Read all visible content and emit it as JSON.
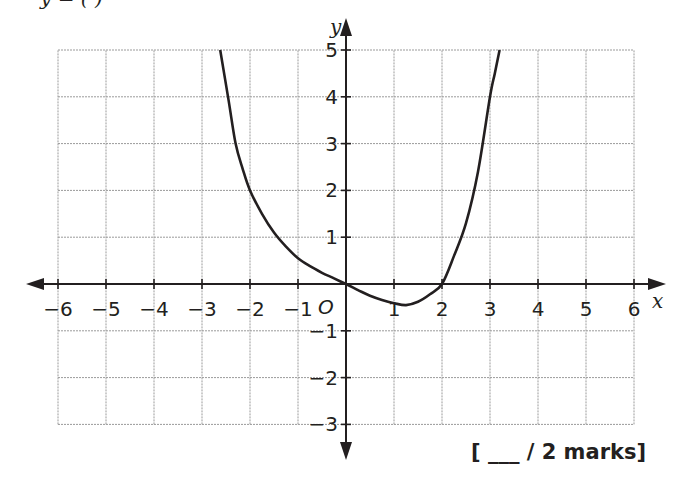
{
  "header": {
    "cut_text": "y = (      )"
  },
  "footer": {
    "marks_label": "[ ___ / 2 marks]"
  },
  "chart_data": {
    "type": "line",
    "title": "",
    "xlabel": "x",
    "ylabel": "y",
    "origin_label": "O",
    "xlim": [
      -6,
      6
    ],
    "ylim": [
      -3,
      5
    ],
    "grid": true,
    "x_ticks": [
      -6,
      -5,
      -4,
      -3,
      -2,
      -1,
      1,
      2,
      3,
      4,
      5,
      6
    ],
    "x_tick_labels": [
      "−6",
      "−5",
      "−4",
      "−3",
      "−2",
      "−1",
      "1",
      "2",
      "3",
      "4",
      "5",
      "6"
    ],
    "y_ticks": [
      -3,
      -2,
      -1,
      1,
      2,
      3,
      4,
      5
    ],
    "y_tick_labels": [
      "−3",
      "−2",
      "−1",
      "1",
      "2",
      "3",
      "4",
      "5"
    ],
    "series": [
      {
        "name": "curve",
        "x": [
          -2.62,
          -2.45,
          -2.3,
          -2.15,
          -2.0,
          -1.75,
          -1.5,
          -1.25,
          -1.0,
          -0.75,
          -0.5,
          -0.25,
          0.0,
          0.25,
          0.5,
          0.75,
          1.0,
          1.25,
          1.5,
          1.75,
          2.0,
          2.25,
          2.5,
          2.75,
          3.0,
          3.1,
          3.2
        ],
        "y": [
          5.0,
          3.95,
          3.0,
          2.45,
          2.0,
          1.5,
          1.1,
          0.8,
          0.55,
          0.38,
          0.24,
          0.12,
          0.0,
          -0.13,
          -0.25,
          -0.34,
          -0.41,
          -0.45,
          -0.38,
          -0.22,
          0.0,
          0.6,
          1.3,
          2.4,
          4.0,
          4.5,
          5.0
        ]
      }
    ],
    "key_points": {
      "y_intercept": [
        0,
        0
      ],
      "x_intercepts": [
        [
          0,
          0
        ],
        [
          2,
          0
        ]
      ],
      "minimum_approx": [
        1.25,
        -0.45
      ]
    }
  }
}
